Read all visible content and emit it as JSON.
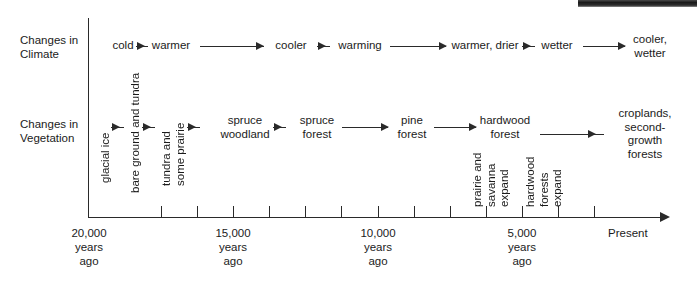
{
  "figure": {
    "rows": [
      {
        "name": "climate",
        "label": "Changes in\nClimate"
      },
      {
        "name": "vegetation",
        "label": "Changes in\nVegetation"
      }
    ],
    "climate_sequence": [
      {
        "text": "cold"
      },
      {
        "text": "warmer"
      },
      {
        "text": "cooler"
      },
      {
        "text": "warming"
      },
      {
        "text": "warmer, drier"
      },
      {
        "text": "wetter"
      },
      {
        "text": "cooler, wetter"
      }
    ],
    "vegetation_sequence": [
      {
        "text": "glacial ice",
        "orientation": "vertical"
      },
      {
        "text": "bare ground and tundra",
        "orientation": "vertical"
      },
      {
        "text": "tundra and\nsome prairie",
        "orientation": "vertical"
      },
      {
        "text": "spruce\nwoodland",
        "orientation": "horizontal"
      },
      {
        "text": "spruce\nforest",
        "orientation": "horizontal"
      },
      {
        "text": "pine\nforest",
        "orientation": "horizontal"
      },
      {
        "text": "hardwood\nforest",
        "orientation": "horizontal"
      },
      {
        "text": "croplands,\nsecond-growth\nforests",
        "orientation": "horizontal"
      }
    ],
    "vegetation_annotations": [
      {
        "text": "prairie and\nsavanna\nexpand",
        "orientation": "vertical"
      },
      {
        "text": "hardwood\nforests\nexpand",
        "orientation": "vertical"
      }
    ],
    "axis": {
      "ticks": [
        {
          "label": "20,000\nyears\nago",
          "labeled": true
        },
        {
          "label": "",
          "labeled": false
        },
        {
          "label": "",
          "labeled": false
        },
        {
          "label": "15,000\nyears\nago",
          "labeled": true
        },
        {
          "label": "",
          "labeled": false
        },
        {
          "label": "",
          "labeled": false
        },
        {
          "label": "10,000\nyears\nago",
          "labeled": true
        },
        {
          "label": "",
          "labeled": false
        },
        {
          "label": "",
          "labeled": false
        },
        {
          "label": "5,000\nyears\nago",
          "labeled": true
        },
        {
          "label": "",
          "labeled": false
        },
        {
          "label": "",
          "labeled": false
        }
      ],
      "end_label": "Present",
      "direction": "left-to-right"
    },
    "colors": {
      "ink": "#1b1b1b",
      "line": "#2a2a2a",
      "background": "#ffffff"
    }
  }
}
